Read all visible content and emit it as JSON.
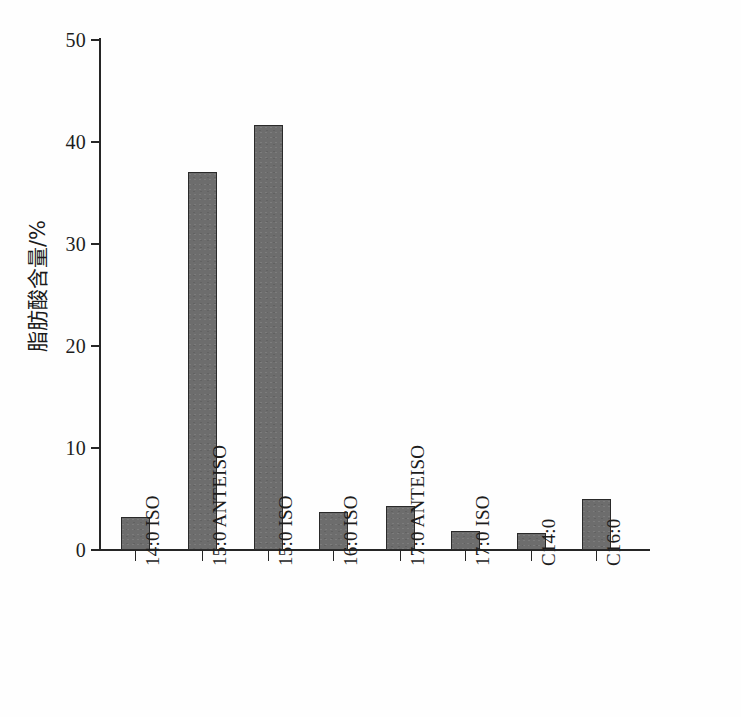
{
  "chart_data": {
    "type": "bar",
    "title": "",
    "xlabel": "",
    "ylabel": "脂肪酸含量/%",
    "ylim": [
      0,
      50
    ],
    "ytick_labels": [
      "50",
      "40",
      "30",
      "20",
      "10",
      "0"
    ],
    "yticks": [
      50,
      40,
      30,
      20,
      10,
      0
    ],
    "grid": false,
    "legend": "none",
    "categories": [
      "14:0 ISO",
      "15:0 ANTEISO",
      "15:0 ISO",
      "16:0 ISO",
      "17:0 ANTEISO",
      "17:0 ISO",
      "C14:0",
      "C16:0"
    ],
    "values": [
      3.2,
      37.1,
      41.7,
      3.7,
      4.3,
      1.9,
      1.7,
      5.0
    ],
    "bar_color": "#6d6d6d",
    "bar_edge_color": "#2a2a2a",
    "axis_color": "#262626",
    "background_color": "#fefefe"
  }
}
